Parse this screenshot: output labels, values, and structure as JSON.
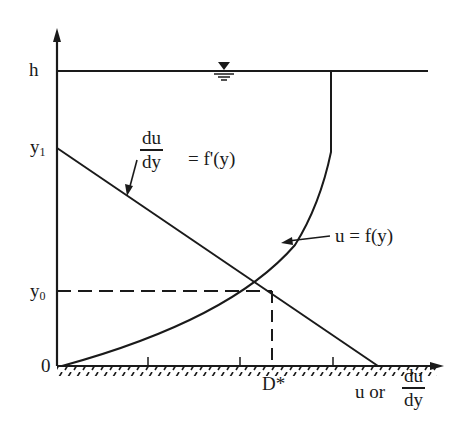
{
  "diagram": {
    "axes": {
      "y_labels": {
        "h": "h",
        "y1": "y",
        "y1_sub": "1",
        "y0": "y",
        "y0_sub": "0",
        "origin": "0"
      },
      "x_label_prefix": "u or",
      "x_label_num": "du",
      "x_label_den": "dy",
      "x_tick_label": "D*"
    },
    "annotations": {
      "gradient_num": "du",
      "gradient_den": "dy",
      "gradient_rhs": "= f'(y)",
      "velocity_label": "u = f(y)"
    },
    "symbols": {
      "water_surface": "free-surface-triangle"
    },
    "colors": {
      "ink": "#1a1a1a",
      "background": "#ffffff"
    }
  }
}
